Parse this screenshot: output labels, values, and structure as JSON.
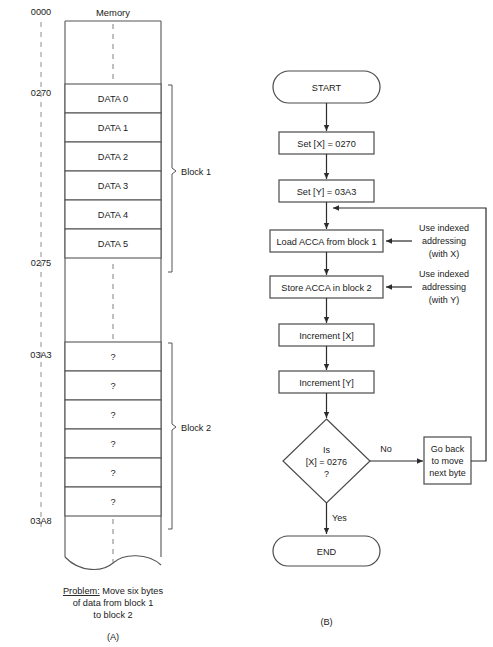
{
  "figure": {
    "panel_a": {
      "label": "(A)",
      "column_title": "Memory",
      "addresses": [
        {
          "value": "0000",
          "y": 18
        },
        {
          "value": "0270",
          "y": 93
        },
        {
          "value": "0275",
          "y": 263
        },
        {
          "value": "03A3",
          "y": 355
        },
        {
          "value": "03A8",
          "y": 521
        }
      ],
      "block1": {
        "label": "Block 1",
        "cells": [
          "DATA 0",
          "DATA 1",
          "DATA 2",
          "DATA 3",
          "DATA 4",
          "DATA 5"
        ]
      },
      "block2": {
        "label": "Block 2",
        "cells": [
          "?",
          "?",
          "?",
          "?",
          "?",
          "?"
        ]
      },
      "caption": {
        "line1_label": "Problem:",
        "line1_rest": " Move six bytes",
        "line2": "of data from block 1",
        "line3": "to block 2"
      }
    },
    "panel_b": {
      "label": "(B)",
      "nodes": {
        "start": "START",
        "set_x": "Set [X] = 0270",
        "set_y": "Set [Y] = 03A3",
        "load": "Load ACCA from block 1",
        "store": "Store ACCA in block 2",
        "inc_x": "Increment [X]",
        "inc_y": "Increment [Y]",
        "decision_line1": "Is",
        "decision_line2": "[X] = 0276",
        "decision_line3": "?",
        "loop_line1": "Go back",
        "loop_line2": "to move",
        "loop_line3": "next byte",
        "end": "END"
      },
      "annotations": {
        "load_note_line1": "Use indexed",
        "load_note_line2": "addressing",
        "load_note_line3": "(with X)",
        "store_note_line1": "Use indexed",
        "store_note_line2": "addressing",
        "store_note_line3": "(with Y)"
      },
      "branch_labels": {
        "no": "No",
        "yes": "Yes"
      }
    }
  },
  "colors": {
    "ink": "#1a1a1a",
    "line": "#4a4a4a",
    "dashed": "#8c8c8c",
    "background": "#ffffff"
  }
}
